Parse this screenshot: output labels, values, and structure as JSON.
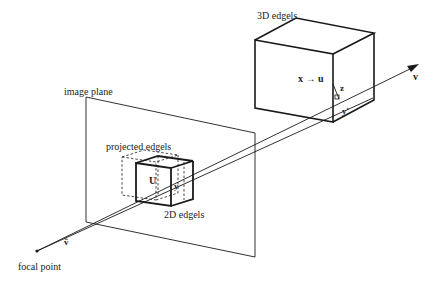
{
  "labels": {
    "edgels_3d": "3D edgels",
    "image_plane": "image plane",
    "projected_edgels": "projected edgels",
    "edgels_2d": "2D edgels",
    "focal_point": "focal point",
    "x_arrow_u": "x → u",
    "z": "z",
    "y_prime": "y'",
    "v": "v",
    "v_hat": "v̂",
    "U": "U",
    "y": "y"
  },
  "colors": {
    "line": "#1a1a1a",
    "background": "#ffffff"
  }
}
